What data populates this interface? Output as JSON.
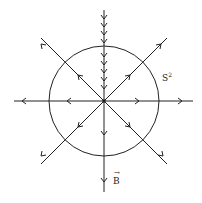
{
  "diagram": {
    "sphere_label": "S",
    "sphere_label_sup": "2",
    "field_label": "B",
    "field_label_vector_mark": "→",
    "stroke_color": "#222222",
    "center": [
      104,
      101
    ],
    "radius": 55
  }
}
